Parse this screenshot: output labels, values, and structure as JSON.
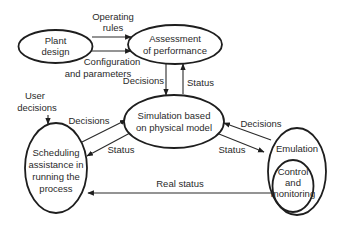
{
  "nodes": {
    "plant_design": {
      "lines": [
        "Plant",
        "design"
      ]
    },
    "assessment": {
      "lines": [
        "Assessment",
        "of performance"
      ]
    },
    "simulation": {
      "lines": [
        "Simulation based",
        "on physical model"
      ]
    },
    "scheduling": {
      "lines": [
        "Scheduling",
        "assistance in",
        "running the",
        "process"
      ]
    },
    "emulation": {
      "lines": [
        "Emulation"
      ]
    },
    "control": {
      "lines": [
        "Control",
        "and",
        "monitoring"
      ]
    }
  },
  "edges": {
    "operating_rules": {
      "lines": [
        "Operating",
        "rules"
      ]
    },
    "configuration": {
      "lines": [
        "Configuration",
        "and parameters"
      ]
    },
    "assess_to_sim_decisions": "Decisions",
    "sim_to_assess_status": "Status",
    "user_decisions": {
      "lines": [
        "User",
        "decisions"
      ]
    },
    "sched_to_sim_decisions": "Decisions",
    "sim_to_sched_status": "Status",
    "emu_to_sim_decisions": "Decisions",
    "sim_to_emu_status": "Status",
    "real_status": "Real status"
  }
}
